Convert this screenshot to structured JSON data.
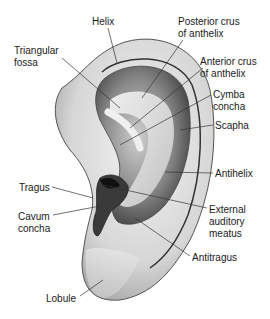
{
  "figure": {
    "labels": [
      {
        "id": "helix",
        "text": "Helix",
        "x": 92,
        "y": 16
      },
      {
        "id": "triangular-fossa",
        "text": "Triangular\nfossa",
        "x": 14,
        "y": 45
      },
      {
        "id": "posterior-crus",
        "text": "Posterior crus\nof anthelix",
        "x": 178,
        "y": 16
      },
      {
        "id": "anterior-crus",
        "text": "Anterior crus\nof anthelix",
        "x": 200,
        "y": 56
      },
      {
        "id": "cymba-concha",
        "text": "Cymba\nconcha",
        "x": 213,
        "y": 89
      },
      {
        "id": "scapha",
        "text": "Scapha",
        "x": 215,
        "y": 120
      },
      {
        "id": "antihelix",
        "text": "Antihelix",
        "x": 215,
        "y": 168
      },
      {
        "id": "tragus",
        "text": "Tragus",
        "x": 19,
        "y": 182
      },
      {
        "id": "external-auditory-meatus",
        "text": "External\nauditory\nmeatus",
        "x": 209,
        "y": 204
      },
      {
        "id": "cavum-concha",
        "text": "Cavum\nconcha",
        "x": 18,
        "y": 211
      },
      {
        "id": "antitragus",
        "text": "Antitragus",
        "x": 192,
        "y": 252
      },
      {
        "id": "lobule",
        "text": "Lobule",
        "x": 46,
        "y": 293
      }
    ],
    "caption": ""
  },
  "colors": {
    "line": "#333333",
    "ear_light": "#eeeeee",
    "ear_mid": "#bbbbbb",
    "ear_dark": "#555555",
    "canal": "#222222"
  }
}
